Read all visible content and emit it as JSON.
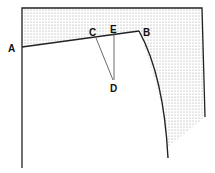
{
  "diagram": {
    "type": "pattern-drafting",
    "labels": {
      "A": "A",
      "B": "B",
      "C": "C",
      "D": "D",
      "E": "E"
    },
    "colors": {
      "line": "#222222",
      "shade_dot": "#9a9a9a",
      "background": "#ffffff"
    }
  }
}
